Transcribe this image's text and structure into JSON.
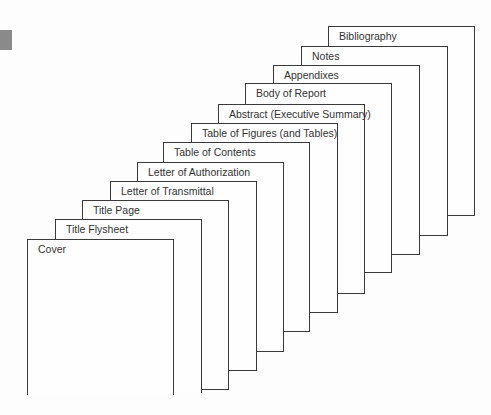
{
  "diagram": {
    "type": "stacked-pages",
    "pages": [
      {
        "label": "Bibliography"
      },
      {
        "label": "Notes"
      },
      {
        "label": "Appendixes"
      },
      {
        "label": "Body of Report"
      },
      {
        "label": "Abstract (Executive Summary)"
      },
      {
        "label": "Table of Figures (and Tables)"
      },
      {
        "label": "Table of Contents"
      },
      {
        "label": "Letter of Authorization"
      },
      {
        "label": "Letter of Transmittal"
      },
      {
        "label": "Title Page"
      },
      {
        "label": "Title Flysheet"
      },
      {
        "label": "Cover"
      }
    ]
  },
  "colors": {
    "line": "#3a3a3a",
    "marker": "#8a8a8a",
    "background": "#fdfdfd"
  }
}
